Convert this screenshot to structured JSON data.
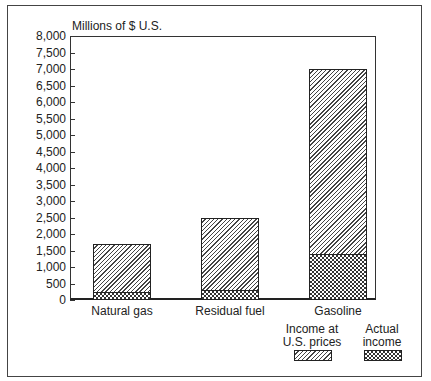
{
  "chart_data": {
    "type": "bar",
    "stacked": true,
    "title": "",
    "ylabel": "Millions of $ U.S.",
    "xlabel": "",
    "ylim": [
      0,
      8000
    ],
    "yticks": [
      "0",
      "500",
      "1,000",
      "1,500",
      "2,000",
      "2,500",
      "3,000",
      "3,500",
      "4,000",
      "4,500",
      "5,000",
      "5,500",
      "6,000",
      "6,500",
      "7,000",
      "7,500",
      "8,000"
    ],
    "categories": [
      "Natural gas",
      "Residual fuel",
      "Gasoline"
    ],
    "series": [
      {
        "name": "Income at U.S. prices",
        "values": [
          1700,
          2500,
          7000
        ],
        "pattern": "diagonal-hatch"
      },
      {
        "name": "Actual income",
        "values": [
          250,
          300,
          1400
        ],
        "pattern": "crosshatch"
      }
    ],
    "legend": {
      "position": "bottom-right",
      "entries": [
        "Income at U.S. prices",
        "Actual income"
      ]
    },
    "grid": false
  },
  "labels": {
    "unit": "Millions of $ U.S.",
    "legend_us_prices": [
      "Income at",
      "U.S. prices"
    ],
    "legend_actual": [
      "Actual",
      "income"
    ]
  }
}
